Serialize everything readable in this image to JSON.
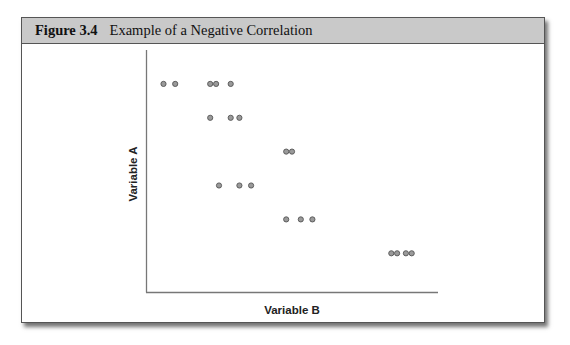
{
  "figure": {
    "number": "Figure 3.4",
    "caption": "Example of a Negative Correlation"
  },
  "chart_data": {
    "type": "scatter",
    "title": "Example of a Negative Correlation",
    "xlabel": "Variable B",
    "ylabel": "Variable A",
    "grid": false,
    "legend": null,
    "ticks": "none",
    "note": "Values are pixel-derived relative positions on unlabeled axes (x: 0=left axis, y: 0=bottom axis).",
    "xlim": [
      0,
      100
    ],
    "ylim": [
      0,
      100
    ],
    "points": [
      {
        "x": 6,
        "y": 86
      },
      {
        "x": 10,
        "y": 86
      },
      {
        "x": 22,
        "y": 86
      },
      {
        "x": 24,
        "y": 86
      },
      {
        "x": 29,
        "y": 86
      },
      {
        "x": 22,
        "y": 72
      },
      {
        "x": 29,
        "y": 72
      },
      {
        "x": 32,
        "y": 72
      },
      {
        "x": 48,
        "y": 58
      },
      {
        "x": 50,
        "y": 58
      },
      {
        "x": 25,
        "y": 44
      },
      {
        "x": 32,
        "y": 44
      },
      {
        "x": 36,
        "y": 44
      },
      {
        "x": 48,
        "y": 30
      },
      {
        "x": 53,
        "y": 30
      },
      {
        "x": 57,
        "y": 30
      },
      {
        "x": 84,
        "y": 16
      },
      {
        "x": 86,
        "y": 16
      },
      {
        "x": 89,
        "y": 16
      },
      {
        "x": 91,
        "y": 16
      }
    ],
    "point_color": "#9a9a9a",
    "point_edge": "#555555"
  }
}
